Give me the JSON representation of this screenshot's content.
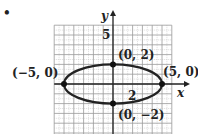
{
  "marker": "•",
  "chart_data": {
    "type": "line",
    "title": "",
    "xlabel": "x",
    "ylabel": "y",
    "xlim": [
      -6,
      6
    ],
    "ylim": [
      -5,
      6
    ],
    "grid": true,
    "curve": "ellipse x^2/25 + y^2/4 = 1",
    "tick_labels": {
      "x": [
        "2"
      ],
      "y": [
        "5"
      ]
    },
    "points": [
      {
        "x": 0,
        "y": 2,
        "label": "(0, 2)"
      },
      {
        "x": 5,
        "y": 0,
        "label": "(5, 0)"
      },
      {
        "x": -5,
        "y": 0,
        "label": "(−5, 0)"
      },
      {
        "x": 0,
        "y": -2,
        "label": "(0, −2)"
      }
    ]
  }
}
